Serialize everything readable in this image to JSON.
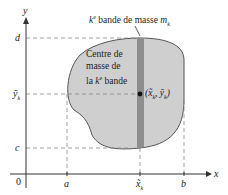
{
  "diagram": {
    "axes": {
      "x_label": "x",
      "y_label": "y",
      "origin_label": "0"
    },
    "x_ticks": [
      {
        "label": "a"
      },
      {
        "label": "x̃",
        "sub": "k"
      },
      {
        "label": "b"
      }
    ],
    "y_ticks": [
      {
        "label": "d"
      },
      {
        "label": "ỹ",
        "sub": "k"
      },
      {
        "label": "c"
      }
    ],
    "strip_label": {
      "k": "k",
      "sup": "e",
      "text": " bande de masse ",
      "m": "m",
      "m_sub": "k"
    },
    "center_label": {
      "line1": "Centre de",
      "line2": "masse de",
      "line3_pre": "la ",
      "k": "k",
      "sup": "e",
      "line3_post": " bande"
    },
    "point_label": {
      "open": "(",
      "x": "x̃",
      "x_sub": "k",
      "sep": ", ",
      "y": "ỹ",
      "y_sub": "k",
      "close": ")"
    },
    "colors": {
      "region": "#cfcfcf",
      "strip": "#8e8e8e",
      "outline": "#555555",
      "axis": "#333333",
      "dash": "#888888"
    }
  }
}
